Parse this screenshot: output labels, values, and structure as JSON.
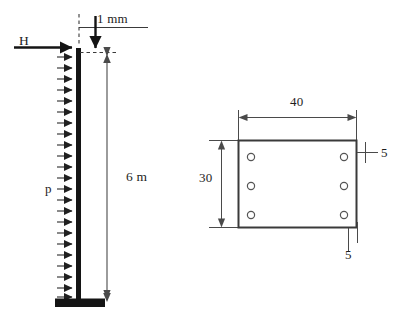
{
  "figure": {
    "left_diagram": {
      "name": "cantilever-column",
      "point_load_label": "H",
      "distributed_load_label": "p",
      "height_dimension": "6 m",
      "tip_deflection": "1 mm",
      "column_height_px": 250,
      "num_load_arrows": 22
    },
    "right_diagram": {
      "name": "base-plate-detail",
      "width_dimension": "40",
      "height_dimension": "30",
      "thickness_right": "5",
      "thickness_bottom": "5",
      "bolt_rows": 3,
      "bolt_columns": 2,
      "bolt_count": 6
    },
    "colors": {
      "line": "#3a3a3a",
      "solid_fill": "#141414",
      "background": "#ffffff"
    }
  }
}
